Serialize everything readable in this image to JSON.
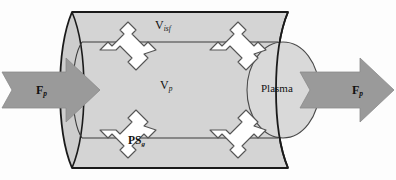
{
  "figure": {
    "colors": {
      "cylinder_body": "#d4d4d4",
      "cylinder_end_cap": "#c9c9c9",
      "plasma_ellipse": "#d9d9d9",
      "flow_arrow": "#9a9a9a",
      "exchange_arrow": "#ffffff",
      "outline": "#1a1a1a",
      "inner_line": "#333333",
      "background": "#fdfdfd"
    },
    "labels": {
      "v_isf": "V",
      "v_isf_sub": "isf",
      "v_p": "V",
      "v_p_sub": "p",
      "ps_g": "PS",
      "ps_g_sub": "g",
      "plasma": "Plasma",
      "f_p_in": "F",
      "f_p_in_sub": "p",
      "f_p_out": "F",
      "f_p_out_sub": "p"
    },
    "elements": {
      "inflow_arrow_name": "plasma-inflow-arrow",
      "outflow_arrow_name": "plasma-outflow-arrow",
      "exchange_arrow_count": 4,
      "cylinder_name": "tissue-cylinder",
      "plasma_region_name": "plasma-ellipse"
    }
  }
}
